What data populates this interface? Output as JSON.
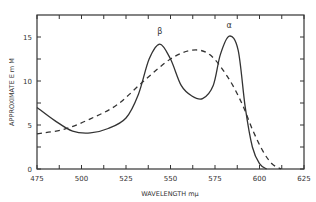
{
  "chart_data": {
    "type": "line",
    "title": "",
    "xlabel": "WAVELENGTH mμ",
    "ylabel": "APPROXIMATE E m M",
    "xlim": [
      475,
      625
    ],
    "ylim": [
      0,
      17
    ],
    "xticks": [
      475,
      500,
      525,
      550,
      575,
      600,
      625
    ],
    "yticks": [
      0,
      5,
      10,
      15
    ],
    "grid": false,
    "annotations": [
      {
        "text": "β",
        "x": 544,
        "y": 15.3
      },
      {
        "text": "α",
        "x": 583,
        "y": 16.0
      }
    ],
    "series": [
      {
        "name": "solid",
        "style": "solid",
        "x": [
          475,
          485,
          495,
          505,
          515,
          525,
          532,
          538,
          544,
          550,
          556,
          562,
          568,
          574,
          578,
          583,
          588,
          592,
          596,
          600,
          604
        ],
        "y": [
          7.0,
          5.5,
          4.3,
          4.1,
          4.6,
          5.8,
          8.5,
          12.5,
          14.2,
          12.5,
          9.5,
          8.3,
          8.0,
          9.5,
          13.0,
          15.1,
          13.5,
          7.0,
          2.5,
          0.6,
          0
        ]
      },
      {
        "name": "dashed",
        "style": "dashed",
        "x": [
          475,
          490,
          505,
          520,
          535,
          550,
          562,
          572,
          582,
          590,
          596,
          602,
          607,
          612
        ],
        "y": [
          4.0,
          4.5,
          5.7,
          7.3,
          10.0,
          12.5,
          13.5,
          13.0,
          10.5,
          7.5,
          4.5,
          2.0,
          0.6,
          0
        ]
      }
    ]
  }
}
